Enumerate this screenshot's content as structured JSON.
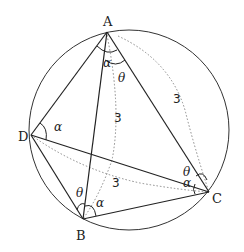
{
  "diagram": {
    "type": "cyclic quadrilateral inscribed in circle",
    "circle": {
      "cx": 129,
      "cy": 130,
      "r": 100
    },
    "points": {
      "A": {
        "label": "A",
        "x": 107,
        "y": 32,
        "lx": 103,
        "ly": 26
      },
      "B": {
        "label": "B",
        "x": 83,
        "y": 219,
        "lx": 76,
        "ly": 240
      },
      "C": {
        "label": "C",
        "x": 209,
        "y": 192,
        "lx": 212,
        "ly": 203
      },
      "D": {
        "label": "D",
        "x": 31,
        "y": 135,
        "lx": 18,
        "ly": 141
      }
    },
    "solid_segments": [
      "AD",
      "AC",
      "AB",
      "DB",
      "DC",
      "BC"
    ],
    "dotted_arcs": [
      "A-to-C radius 3",
      "A-to-B radius 3",
      "D-to-C radius 3"
    ],
    "length_labels": [
      {
        "text": "3",
        "x": 173,
        "y": 103
      },
      {
        "text": "3",
        "x": 114,
        "y": 122
      },
      {
        "text": "3",
        "x": 112,
        "y": 187
      }
    ],
    "angle_labels": [
      {
        "text": "α",
        "x": 103,
        "y": 67,
        "at": "A"
      },
      {
        "text": "θ",
        "x": 118,
        "y": 82,
        "at": "A"
      },
      {
        "text": "α",
        "x": 54,
        "y": 131,
        "at": "D"
      },
      {
        "text": "θ",
        "x": 76,
        "y": 197,
        "at": "B"
      },
      {
        "text": "α",
        "x": 96,
        "y": 207,
        "at": "B"
      },
      {
        "text": "θ",
        "x": 183,
        "y": 176,
        "at": "C"
      },
      {
        "text": "α",
        "x": 183,
        "y": 187,
        "at": "C"
      }
    ],
    "colors": {
      "line": "#222222",
      "dotted": "#888888",
      "background": "#ffffff"
    }
  }
}
